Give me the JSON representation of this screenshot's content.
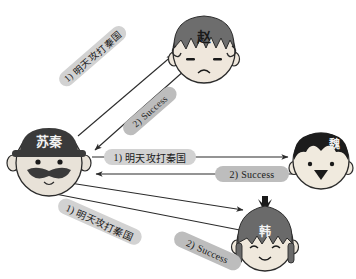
{
  "diagram": {
    "background_color": "#ffffff",
    "line_color": "#2b2b2b",
    "pill_command_color": "#d2d2d2",
    "pill_success_color": "#bdbdbd"
  },
  "actors": {
    "center": {
      "name": "苏秦",
      "role": "coordinator",
      "hat_color": "#3a3a3a",
      "skin_color": "#e8e2d8",
      "face_expression": "mustache"
    },
    "top": {
      "name": "赵",
      "role": "state",
      "hair_color": "#6d6d6d",
      "skin_color": "#efe7dc",
      "face_expression": "frown"
    },
    "right": {
      "name": "魏",
      "role": "state",
      "hair_color": "#1c1c1c",
      "skin_color": "#f0eade",
      "face_expression": "neutral"
    },
    "bottom": {
      "name": "韩",
      "role": "state",
      "hair_color": "#6a6a6a",
      "skin_color": "#efe8dc",
      "face_expression": "smile"
    }
  },
  "messages": [
    {
      "id": "zhao-command",
      "num": "1)",
      "text": "明天攻打秦国",
      "from": "苏秦",
      "to": "赵",
      "kind": "command"
    },
    {
      "id": "zhao-success",
      "num": "2)",
      "text": "Success",
      "from": "赵",
      "to": "苏秦",
      "kind": "success"
    },
    {
      "id": "wei-command",
      "num": "1)",
      "text": "明天攻打秦国",
      "from": "苏秦",
      "to": "魏",
      "kind": "command"
    },
    {
      "id": "wei-success",
      "num": "2)",
      "text": "Success",
      "from": "魏",
      "to": "苏秦",
      "kind": "success"
    },
    {
      "id": "han-command",
      "num": "1)",
      "text": "明天攻打秦国",
      "from": "苏秦",
      "to": "韩",
      "kind": "command"
    },
    {
      "id": "han-success",
      "num": "2)",
      "text": "Success",
      "from": "韩",
      "to": "苏秦",
      "kind": "success"
    }
  ]
}
